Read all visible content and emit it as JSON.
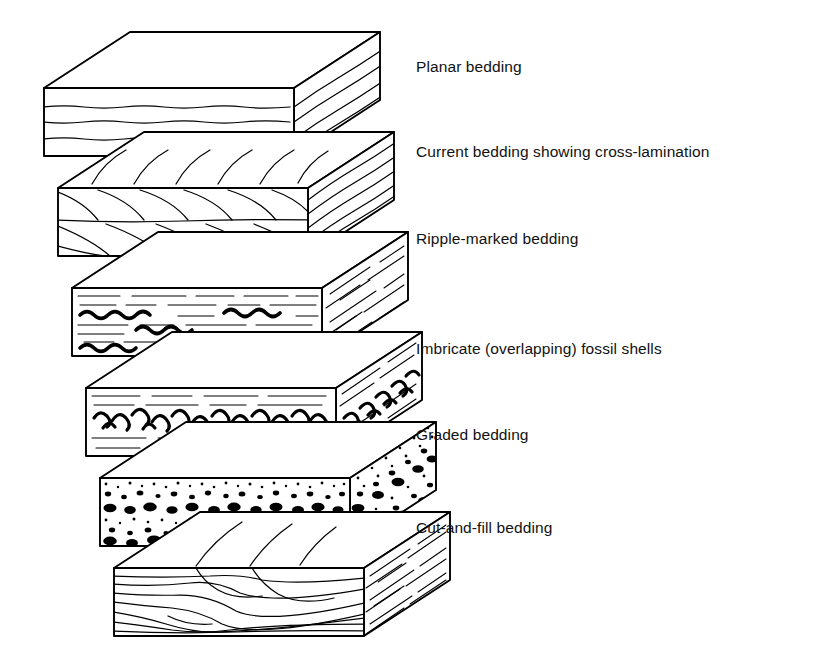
{
  "figure": {
    "background_color": "#ffffff",
    "line_color": "#000000",
    "style": "line-drawing"
  },
  "labels": [
    {
      "id": "planar",
      "text": "Planar bedding",
      "x": 416,
      "y": 72
    },
    {
      "id": "current",
      "text": "Current bedding showing cross-lamination",
      "x": 416,
      "y": 157
    },
    {
      "id": "ripple",
      "text": "Ripple-marked bedding",
      "x": 416,
      "y": 244
    },
    {
      "id": "imbricate",
      "text": "Imbricate (overlapping) fossil shells",
      "x": 416,
      "y": 354
    },
    {
      "id": "graded",
      "text": "Graded bedding",
      "x": 416,
      "y": 440
    },
    {
      "id": "cutfill",
      "text": "Cut-and-fill bedding",
      "x": 416,
      "y": 533
    }
  ],
  "blocks": [
    {
      "id": "planar",
      "label": "Planar bedding",
      "pattern": "horizontal-wavy-laminations",
      "description": "Evenly stacked flat parallel layers",
      "front_x": 44,
      "front_y": 88,
      "width": 250,
      "height": 68
    },
    {
      "id": "current",
      "label": "Current bedding showing cross-lamination",
      "pattern": "curved-foresets",
      "description": "Two sets of concave foreset laminae truncated at bounding surfaces",
      "front_x": 58,
      "front_y": 188,
      "width": 250,
      "height": 68
    },
    {
      "id": "ripple",
      "label": "Ripple-marked bedding",
      "pattern": "wavy-ripple-bands",
      "description": "Thick wavy ripple crests between dashed laminae",
      "front_x": 72,
      "front_y": 288,
      "width": 250,
      "height": 68
    },
    {
      "id": "imbricate",
      "label": "Imbricate (overlapping) fossil shells",
      "pattern": "crescent-shells",
      "description": "Band of overlapping curved shell outlines",
      "front_x": 86,
      "front_y": 388,
      "width": 250,
      "height": 68
    },
    {
      "id": "graded",
      "label": "Graded bedding",
      "pattern": "graded-grains",
      "description": "Stippled grains fining upward, coarse blobs at base of each unit",
      "front_x": 100,
      "front_y": 478,
      "width": 250,
      "height": 68
    },
    {
      "id": "cutfill",
      "label": "Cut-and-fill bedding",
      "pattern": "scour-and-fill",
      "description": "Channel scours truncating underlying laminae, filled by later beds",
      "front_x": 114,
      "front_y": 568,
      "width": 250,
      "height": 68
    }
  ]
}
